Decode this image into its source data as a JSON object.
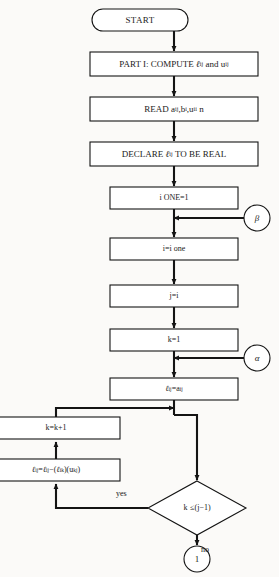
{
  "diagram": {
    "background_color": "#fbfaf8",
    "stroke_color": "#141414",
    "fill_color": "#ffffff",
    "nodes": [
      {
        "id": "start",
        "shape": "terminator",
        "text": "START",
        "x": 92,
        "y": 9,
        "w": 96,
        "h": 22,
        "font_size": 9
      },
      {
        "id": "part1",
        "shape": "process",
        "text": "PART I: COMPUTE ℓij and uij",
        "x": 90,
        "y": 52,
        "w": 168,
        "h": 24,
        "font_size": 9
      },
      {
        "id": "read",
        "shape": "process",
        "text": "READ aij,bi,uii n",
        "x": 90,
        "y": 97,
        "w": 168,
        "h": 24,
        "font_size": 9
      },
      {
        "id": "declare",
        "shape": "process",
        "text": "DECLARE ℓij TO BE REAL",
        "x": 90,
        "y": 142,
        "w": 168,
        "h": 24,
        "font_size": 9
      },
      {
        "id": "ione",
        "shape": "process",
        "text": "i ONE=1",
        "x": 110,
        "y": 187,
        "w": 128,
        "h": 22,
        "font_size": 8
      },
      {
        "id": "iione",
        "shape": "process",
        "text": "i=i one",
        "x": 110,
        "y": 238,
        "w": 128,
        "h": 22,
        "font_size": 8
      },
      {
        "id": "ji",
        "shape": "process",
        "text": "j=i",
        "x": 110,
        "y": 285,
        "w": 128,
        "h": 22,
        "font_size": 8
      },
      {
        "id": "k1",
        "shape": "process",
        "text": "k=1",
        "x": 110,
        "y": 329,
        "w": 128,
        "h": 22,
        "font_size": 8
      },
      {
        "id": "lij",
        "shape": "process",
        "text": "ℓij=aij",
        "x": 110,
        "y": 378,
        "w": 128,
        "h": 22,
        "font_size": 8
      },
      {
        "id": "kk1",
        "shape": "process",
        "text": "k=k+1",
        "x": -8,
        "y": 417,
        "w": 128,
        "h": 22,
        "font_size": 8
      },
      {
        "id": "update",
        "shape": "process",
        "text": "ℓij=ℓij−(ℓik)(ukj)",
        "x": -8,
        "y": 459,
        "w": 128,
        "h": 22,
        "font_size": 8
      },
      {
        "id": "decision",
        "shape": "decision",
        "text": "k ≤ (j−1)",
        "x": 148,
        "y": 481,
        "w": 98,
        "h": 54,
        "font_size": 8
      },
      {
        "id": "beta",
        "shape": "connector",
        "text": "β",
        "x": 244,
        "y": 205,
        "w": 26,
        "h": 26,
        "font_size": 9
      },
      {
        "id": "alpha",
        "shape": "connector",
        "text": "α",
        "x": 244,
        "y": 345,
        "w": 26,
        "h": 26,
        "font_size": 9
      },
      {
        "id": "one",
        "shape": "connector",
        "text": "1",
        "x": 184,
        "y": 546,
        "w": 26,
        "h": 26,
        "font_size": 9
      }
    ],
    "edge_labels": [
      {
        "id": "yes",
        "text": "yes",
        "x": 116,
        "y": 489
      },
      {
        "id": "no",
        "text": "no",
        "x": 201,
        "y": 545
      }
    ]
  }
}
